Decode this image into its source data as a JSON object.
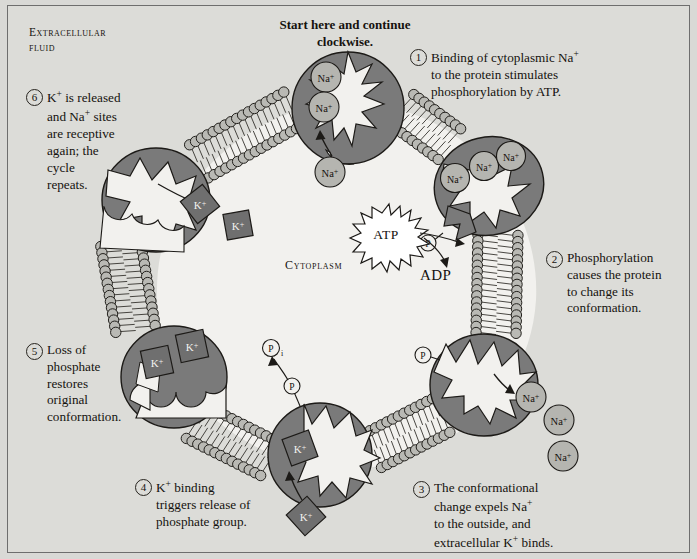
{
  "diagram": {
    "title_instruction": "Start here and continue clockwise.",
    "region_labels": {
      "extracellular": "Extracellular fluid",
      "extracellular_line1": "Extracellular",
      "extracellular_line2": "fluid",
      "cytoplasm": "Cytoplasm"
    },
    "molecules": {
      "atp": "ATP",
      "adp": "ADP",
      "phosphate": "P",
      "phosphate_inorganic": "P",
      "phosphate_subscript": "i",
      "sodium": "Na",
      "sodium_charge": "+",
      "potassium": "K",
      "potassium_charge": "+"
    },
    "steps": [
      {
        "number": "1",
        "marker": "①",
        "text": "Binding of cytoplasmic Na+ to the protein stimulates phosphorylation by ATP.",
        "lines": [
          "Binding of cytoplasmic Na",
          "to the protein stimulates",
          "phosphorylation by ATP."
        ]
      },
      {
        "number": "2",
        "marker": "②",
        "text": "Phosphorylation causes the protein to change its conformation.",
        "lines": [
          "Phosphorylation",
          "causes the protein",
          "to change its",
          "conformation."
        ]
      },
      {
        "number": "3",
        "marker": "③",
        "text": "The conformational change expels Na+ to the outside, and extracellular K+ binds.",
        "lines": [
          "The conformational",
          "change expels Na",
          "to the outside, and",
          "extracellular K+ binds."
        ]
      },
      {
        "number": "4",
        "marker": "④",
        "text": "K+ binding triggers release of phosphate group.",
        "lines": [
          "K+ binding",
          "triggers release of",
          "phosphate group."
        ]
      },
      {
        "number": "5",
        "marker": "⑤",
        "text": "Loss of phosphate restores original conformation.",
        "lines": [
          "Loss of",
          "phosphate",
          "restores",
          "original",
          "conformation."
        ]
      },
      {
        "number": "6",
        "marker": "⑥",
        "text": "K+ is released and Na+ sites are receptive again; the cycle repeats.",
        "lines": [
          "K+ is released",
          "and Na+ sites",
          "are receptive",
          "again; the",
          "cycle",
          "repeats."
        ]
      }
    ],
    "ion_counts": {
      "sodium_bound_top": 2,
      "sodium_entering_top": 1,
      "sodium_bound_right": 3,
      "sodium_expelled_lower_right": 3,
      "potassium_released_left": 2,
      "potassium_bound_lower_left": 2,
      "potassium_bound_bottom": 1,
      "potassium_entering_bottom": 1
    },
    "colors": {
      "background": "#d9d9d6",
      "panel": "#dcdcd8",
      "cytoplasm_fill": "#f2f1ee",
      "protein_fill": "#7a7a7a",
      "protein_stroke": "#1c1a17",
      "lipid_head_fill": "#b9b9b4",
      "ion_fill": "#b5b5b0",
      "potassium_fill": "#6f6f6f",
      "text": "#15120e",
      "atp_fill": "#ffffff"
    }
  }
}
